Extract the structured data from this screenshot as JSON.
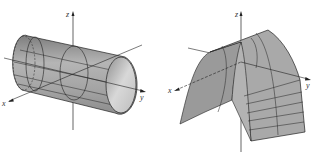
{
  "figures": [
    {
      "id": "cylinder",
      "description": "Circular cylinder with axis along y-axis",
      "axes": {
        "x": "x",
        "y": "y",
        "z": "z"
      }
    },
    {
      "id": "parabolic-cylinder",
      "description": "Parabolic cylinder (arch) surface extending along x",
      "axes": {
        "x": "x",
        "y": "y",
        "z": "z"
      }
    }
  ],
  "colors": {
    "surface": "#a8a8a8",
    "surface_light": "#d6d6d6",
    "surface_dark": "#8a8a8a",
    "lines": "#222222",
    "background": "#ffffff"
  }
}
